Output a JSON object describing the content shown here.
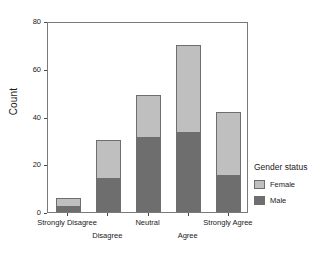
{
  "chart_data": {
    "type": "bar",
    "stacked": true,
    "title": "",
    "xlabel": "",
    "ylabel": "Count",
    "ylim": [
      0,
      80
    ],
    "yticks": [
      0,
      20,
      40,
      60,
      80
    ],
    "grid": false,
    "legend_position": "right",
    "categories": [
      "Strongly Disagree",
      "Disagree",
      "Neutral",
      "Agree",
      "Strongly Agree"
    ],
    "series": [
      {
        "name": "Male",
        "color": "#6e6e6e",
        "values": [
          2,
          14,
          31,
          33,
          15
        ]
      },
      {
        "name": "Female",
        "color": "#bfbfbf",
        "values": [
          4,
          16,
          18,
          37,
          27
        ]
      }
    ],
    "totals": [
      6,
      30,
      49,
      70,
      42
    ]
  },
  "axes": {
    "y": {
      "title": "Count",
      "ticks": [
        {
          "label": "80",
          "value": 80
        },
        {
          "label": "60",
          "value": 60
        },
        {
          "label": "40",
          "value": 40
        },
        {
          "label": "20",
          "value": 20
        },
        {
          "label": "0",
          "value": 0
        }
      ]
    },
    "x": {
      "ticks": [
        {
          "label": "Strongly Disagree",
          "row": 0
        },
        {
          "label": "Disagree",
          "row": 1
        },
        {
          "label": "Neutral",
          "row": 0
        },
        {
          "label": "Agree",
          "row": 1
        },
        {
          "label": "Strongly Agree",
          "row": 0
        }
      ]
    }
  },
  "legend": {
    "title": "Gender status",
    "items": [
      {
        "label": "Female",
        "color": "#bfbfbf"
      },
      {
        "label": "Male",
        "color": "#6e6e6e"
      }
    ]
  },
  "colors": {
    "female": "#bfbfbf",
    "male": "#6e6e6e",
    "axis": "#7a7a7a",
    "text": "#1a1a1a",
    "background": "#ffffff"
  }
}
